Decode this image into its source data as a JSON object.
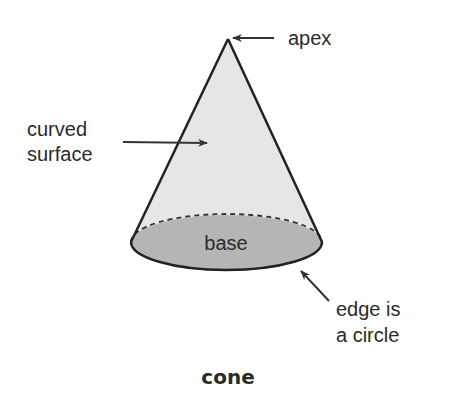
{
  "diagram": {
    "title": "cone",
    "labels": {
      "apex": "apex",
      "curved_surface_line1": "curved",
      "curved_surface_line2": "surface",
      "base": "base",
      "edge_line1": "edge is",
      "edge_line2": "a circle"
    },
    "colors": {
      "background": "#ffffff",
      "outline": "#222222",
      "curved_surface_fill": "#e6e6e6",
      "base_fill": "#b5b5b5",
      "text": "#2b2b2b",
      "arrow": "#333333"
    }
  }
}
